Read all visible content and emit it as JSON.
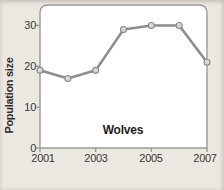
{
  "chart_data": {
    "type": "line",
    "title": "Wolves",
    "xlabel": "",
    "ylabel": "Population size",
    "x": [
      2001,
      2002,
      2003,
      2004,
      2005,
      2006,
      2007
    ],
    "series": [
      {
        "name": "Wolves",
        "values": [
          19,
          17,
          19,
          29,
          30,
          30,
          21
        ]
      }
    ],
    "xlim": [
      2001,
      2007
    ],
    "ylim": [
      0,
      35
    ],
    "xticks": [
      2001,
      2003,
      2005,
      2007
    ],
    "yticks": [
      0,
      10,
      20,
      30
    ],
    "grid": false,
    "legend": "none",
    "colors": {
      "background": "#ebe8e2",
      "plot_area": "#ffffff",
      "axis": "#9b9b9b",
      "line": "#8d8d8d",
      "marker_fill": "#d8d8d8",
      "marker_stroke": "#8a8a8a",
      "text": "#3a3835"
    }
  }
}
